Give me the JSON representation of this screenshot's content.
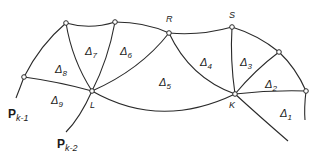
{
  "figure": {
    "vertices": {
      "A": {
        "x": 24,
        "y": 77
      },
      "B": {
        "x": 66,
        "y": 23
      },
      "C": {
        "x": 115,
        "y": 22
      },
      "R": {
        "x": 169,
        "y": 33
      },
      "S": {
        "x": 232,
        "y": 27
      },
      "T": {
        "x": 279,
        "y": 52
      },
      "U": {
        "x": 306,
        "y": 91
      },
      "L": {
        "x": 92,
        "y": 91
      },
      "K": {
        "x": 235,
        "y": 94
      }
    },
    "point_labels": {
      "R": "R",
      "S": "S",
      "L": "L",
      "K": "K"
    },
    "p_labels": {
      "pk1_main": "P",
      "pk1_sub": "k-1",
      "pk2_main": "P",
      "pk2_sub": "k-2"
    },
    "triangles": [
      {
        "id": "1",
        "symbol": "Δ",
        "sub": "1"
      },
      {
        "id": "2",
        "symbol": "Δ",
        "sub": "2"
      },
      {
        "id": "3",
        "symbol": "Δ",
        "sub": "3"
      },
      {
        "id": "4",
        "symbol": "Δ",
        "sub": "4"
      },
      {
        "id": "5",
        "symbol": "Δ",
        "sub": "5"
      },
      {
        "id": "6",
        "symbol": "Δ",
        "sub": "6"
      },
      {
        "id": "7",
        "symbol": "Δ",
        "sub": "7"
      },
      {
        "id": "8",
        "symbol": "Δ",
        "sub": "8"
      },
      {
        "id": "9",
        "symbol": "Δ",
        "sub": "9"
      }
    ],
    "colors": {
      "stroke": "#2a2a2a",
      "background": "#ffffff"
    }
  }
}
